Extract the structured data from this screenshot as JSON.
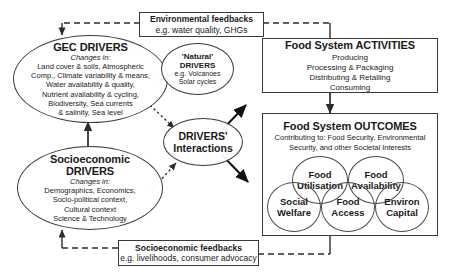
{
  "diagram": {
    "stroke_color": "#3a3a3a",
    "background": "#ffffff"
  },
  "feedbacks": {
    "environmental": {
      "title": "Environmental feedbacks",
      "subtitle": "e.g. water quality, GHGs"
    },
    "socioeconomic": {
      "title": "Socioeconomic feedbacks",
      "subtitle": "e.g. livelihoods, consumer advocacy"
    }
  },
  "drivers": {
    "gec": {
      "title": "GEC DRIVERS",
      "changes_label": "Changes in:",
      "body": "Land cover & soils, Atmospheric\nComp., Climate variability & means,\nWater availability & quality,\nNutrient availability & cycling,\nBiodiversity, Sea currents\n& salinity, Sea level"
    },
    "socioeconomic": {
      "title_line1": "Socioeconomic",
      "title_line2": "DRIVERS",
      "changes_label": "Changes in:",
      "body": "Demographics, Economics,\nSocio-political context,\nCultural context\nScience & Technology"
    },
    "natural": {
      "title_line1": "'Natural'",
      "title_line2": "DRIVERS",
      "body": "e.g. Volcanoes\nSolar cycles"
    },
    "interactions": {
      "title_line1": "DRIVERS'",
      "title_line2": "Interactions"
    }
  },
  "food_system": {
    "activities": {
      "title": "Food System ACTIVITIES",
      "items": "Producing\nProcessing & Packaging\nDistributing & Retailing\nConsuming"
    },
    "outcomes": {
      "title": "Food System OUTCOMES",
      "subtitle": "Contributing to: Food Security, Environmental\nSecurity, and other Societal Interests",
      "circles": [
        {
          "line1": "Food",
          "line2": "Utilisation"
        },
        {
          "line1": "Food",
          "line2": "Availability"
        },
        {
          "line1": "Social",
          "line2": "Welfare"
        },
        {
          "line1": "Food",
          "line2": "Access"
        },
        {
          "line1": "Environ",
          "line2": "Capital"
        }
      ]
    }
  }
}
